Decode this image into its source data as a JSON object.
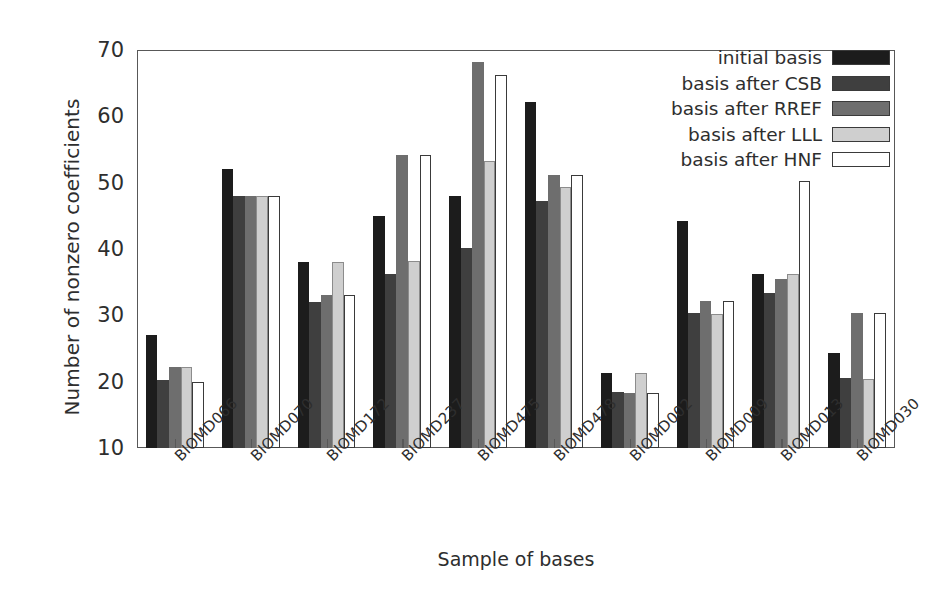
{
  "chart_data": {
    "type": "bar",
    "title": "",
    "xlabel": "Sample of bases",
    "ylabel": "Number of nonzero coefficients",
    "ylim": [
      10,
      70
    ],
    "yticks": [
      10,
      20,
      30,
      40,
      50,
      60,
      70
    ],
    "grid": false,
    "legend_position": "top-right",
    "categories": [
      "BIOMD066",
      "BIOMD070",
      "BIOMD172",
      "BIOMD237",
      "BIOMD475",
      "BIOMD478",
      "BIOMD002",
      "BIOMD009",
      "BIOMD013",
      "BIOMD030"
    ],
    "series": [
      {
        "name": "initial basis",
        "color": "#1c1c1c",
        "values": [
          27.0,
          52.0,
          38.0,
          45.0,
          48.0,
          62.2,
          21.3,
          44.2,
          36.3,
          24.3
        ]
      },
      {
        "name": "basis after CSB",
        "color": "#3f3f3f",
        "values": [
          20.2,
          48.0,
          32.0,
          36.2,
          40.2,
          47.3,
          18.5,
          30.3,
          33.4,
          20.5
        ]
      },
      {
        "name": "basis after RREF",
        "color": "#6e6e6e",
        "values": [
          22.2,
          48.0,
          33.0,
          54.1,
          68.2,
          51.1,
          18.3,
          32.2,
          35.5,
          30.3
        ]
      },
      {
        "name": "basis after LLL",
        "color": "#cfcfcf",
        "values": [
          22.2,
          48.0,
          38.0,
          38.2,
          53.2,
          49.4,
          21.3,
          30.2,
          36.3,
          20.4
        ]
      },
      {
        "name": "basis after HNF",
        "color": "#ffffff",
        "values": [
          20.0,
          48.0,
          33.0,
          54.1,
          66.2,
          51.1,
          18.3,
          32.2,
          50.2,
          30.3
        ]
      }
    ]
  },
  "axes": {
    "ylabel": "Number of nonzero coefficients",
    "xlabel": "Sample of bases",
    "ytick_labels": [
      "70",
      "60",
      "50",
      "40",
      "30",
      "20",
      "10"
    ],
    "xtick_labels": [
      "BIOMD066",
      "BIOMD070",
      "BIOMD172",
      "BIOMD237",
      "BIOMD475",
      "BIOMD478",
      "BIOMD002",
      "BIOMD009",
      "BIOMD013",
      "BIOMD030"
    ]
  },
  "legend": {
    "entries": [
      {
        "label": "initial basis",
        "color": "#1c1c1c"
      },
      {
        "label": "basis after CSB",
        "color": "#3f3f3f"
      },
      {
        "label": "basis after RREF",
        "color": "#6e6e6e"
      },
      {
        "label": "basis after LLL",
        "color": "#cfcfcf"
      },
      {
        "label": "basis after HNF",
        "color": "#ffffff"
      }
    ]
  },
  "style": {
    "frame_color": "#585858",
    "text_color": "#2e2e2e",
    "background": "#ffffff"
  }
}
